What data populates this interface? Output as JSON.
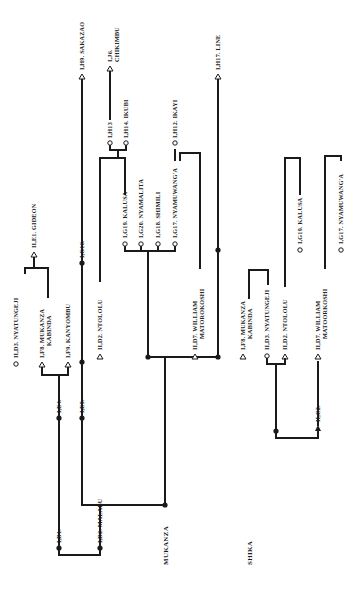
{
  "diagram": {
    "orientation": "rotated-90-ccw",
    "groups": [
      {
        "id": "mukanza",
        "title": "MUKANZA"
      },
      {
        "id": "shika",
        "title": "SHIKA"
      }
    ],
    "mukanza": {
      "title": "MUKANZA",
      "labels": {
        "id1": "I,D1.",
        "id2": "I,D2.  MALABU",
        "ie4": "I,E4.",
        "ie5": "I,E5.",
        "iid3": "II,D3.  NYATUNGEJI",
        "if8_a": "I,F8.  MUKANZA",
        "if8_b": "KABINDA",
        "if9": "I,F9.  KANYOMBU",
        "iie1": "II,E1.  GIDEON",
        "ig16": "I,G16.",
        "ih9": "I,H9.  SAKAZAO",
        "iid2": "II,D2.  NTOLOLU",
        "ig19": "I,G19.  KALUSA",
        "ig20": "I,G20.  NYAMALITA",
        "ig18": "I,G18.  SHIMILI",
        "ig17": "I,G17.  NYAMUWANG'A",
        "ih13": "I,H13",
        "ih14": "I,H14.  IKUBI",
        "ij6_a": "I,J6.",
        "ij6_b": "CHIKIMBU",
        "ih12": "I,H12.  IKAYI",
        "iid7_a": "II,D7.  WILLIAM",
        "iid7_b": "MATOROKOSHI",
        "ih17": "I,H17.  LINE"
      }
    },
    "shika": {
      "title": "SHIKA",
      "labels": {
        "if8_a": "I,F8.  MUKANZA",
        "if8_b": "KABINDA",
        "iid3": "II,D3.  NYATUNGEJI",
        "iid2": "II,D2.  NTOLOLU",
        "iid7_a": "II,D7.  WILLIAM",
        "iid7_b": "MATOORKOSHI",
        "iic2": "II,C2.",
        "ig19": "I,G19.  KALUSA",
        "ig17": "I,G17.  NYAMUWANG'A"
      }
    },
    "legend_symbols": {
      "triangle": "male",
      "circle": "female",
      "filled-dot": "deceased-or-unspecified"
    },
    "colors": {
      "ink": "#1a1a1a",
      "paper": "#ffffff"
    }
  }
}
